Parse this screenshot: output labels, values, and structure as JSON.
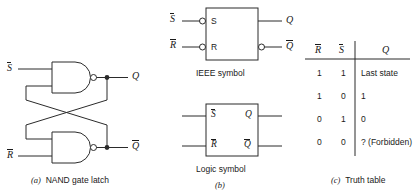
{
  "figure": {
    "panels": [
      {
        "id": "a",
        "caption_tag": "(a)",
        "caption_text": "NAND gate latch",
        "inputs": [
          {
            "name": "S-bar",
            "label": "S",
            "overbar": true
          },
          {
            "name": "R-bar",
            "label": "R",
            "overbar": true
          }
        ],
        "outputs": [
          {
            "name": "Q",
            "label": "Q",
            "overbar": false
          },
          {
            "name": "Q-bar",
            "label": "Q",
            "overbar": true
          }
        ],
        "gates": [
          {
            "name": "nand-gate-top",
            "type": "NAND"
          },
          {
            "name": "nand-gate-bottom",
            "type": "NAND"
          }
        ]
      },
      {
        "id": "b",
        "caption_tag": "(b)",
        "ieee": {
          "title": "IEEE symbol",
          "inputs": [
            {
              "name": "S-bar",
              "ext_label": "S",
              "ext_overbar": true,
              "pin_label": "S",
              "bubble": true
            },
            {
              "name": "R-bar",
              "ext_label": "R",
              "ext_overbar": true,
              "pin_label": "R",
              "bubble": true
            }
          ],
          "outputs": [
            {
              "name": "Q",
              "ext_label": "Q",
              "ext_overbar": false,
              "bubble": false
            },
            {
              "name": "Q-bar",
              "ext_label": "Q",
              "ext_overbar": true,
              "bubble": true
            }
          ]
        },
        "logic": {
          "title": "Logic symbol",
          "inputs": [
            {
              "name": "S-bar",
              "pin_label": "S",
              "overbar": true
            },
            {
              "name": "R-bar",
              "pin_label": "R",
              "overbar": true
            }
          ],
          "outputs": [
            {
              "name": "Q",
              "pin_label": "Q",
              "overbar": false
            },
            {
              "name": "Q-bar",
              "pin_label": "Q",
              "overbar": true
            }
          ]
        }
      },
      {
        "id": "c",
        "caption_tag": "(c)",
        "caption_text": "Truth table"
      }
    ]
  },
  "truth_table": {
    "headers": [
      {
        "label": "R",
        "overbar": true
      },
      {
        "label": "S",
        "overbar": true
      },
      {
        "label": "Q",
        "overbar": false
      }
    ],
    "rows": [
      {
        "R_bar": "1",
        "S_bar": "1",
        "Q": "Last state"
      },
      {
        "R_bar": "1",
        "S_bar": "0",
        "Q": "1"
      },
      {
        "R_bar": "0",
        "S_bar": "1",
        "Q": "0"
      },
      {
        "R_bar": "0",
        "S_bar": "0",
        "Q": "? (Forbidden)"
      }
    ]
  },
  "colors": {
    "ink": "#1a1a1a",
    "line": "#2b2b2b",
    "background": "#ffffff"
  }
}
